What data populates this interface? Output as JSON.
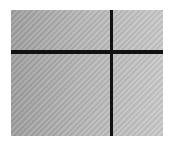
{
  "image": {
    "description": "Gray textured panel divided by a black horizontal and vertical line",
    "colors": {
      "panel_dark": "#9e9e9e",
      "panel_light": "#c8c8c8",
      "line": "#111111",
      "background": "#ffffff"
    }
  }
}
